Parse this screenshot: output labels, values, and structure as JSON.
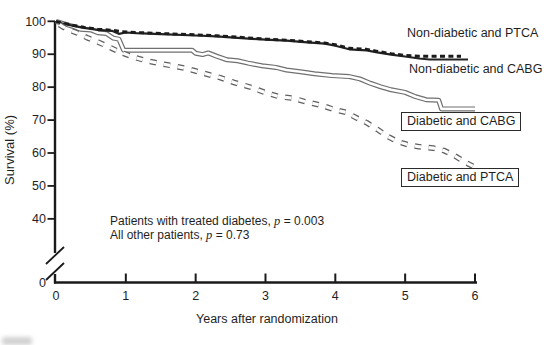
{
  "colors": {
    "axis": "#1a1a1a",
    "text": "#1f1f1f",
    "line_dark": "#232323",
    "line_dark_dashed": "#1b1b1b",
    "tube_edge": "#6f6f6f",
    "tube_fill": "#ffffff",
    "open_dash_edge": "#5f5f5f",
    "open_dash_fill": "#ffffff",
    "background": "#ffffff"
  },
  "chart_data": {
    "type": "line",
    "title": "",
    "xlabel": "Years after randomization",
    "ylabel": "Survival (%)",
    "x_ticks": [
      0,
      1,
      2,
      3,
      4,
      5,
      6
    ],
    "y_ticks": [
      100,
      90,
      80,
      70,
      60,
      50,
      40
    ],
    "y_origin_label": "0",
    "y_axis_break": true,
    "xlim": [
      0,
      6
    ],
    "ylim": [
      40,
      100
    ],
    "grid": false,
    "legend_position": "right-inline",
    "series": [
      {
        "name": "Diabetic and CABG",
        "style": "tube",
        "points": [
          [
            0,
            100
          ],
          [
            0.12,
            99.2
          ],
          [
            0.25,
            98.4
          ],
          [
            0.35,
            97.6
          ],
          [
            0.5,
            97.4
          ],
          [
            0.6,
            96.5
          ],
          [
            0.72,
            96.3
          ],
          [
            0.82,
            94.9
          ],
          [
            0.9,
            94.6
          ],
          [
            0.97,
            91.2
          ],
          [
            1.95,
            91.2
          ],
          [
            2.0,
            90.3
          ],
          [
            2.1,
            89.9
          ],
          [
            2.18,
            90.4
          ],
          [
            2.3,
            89.4
          ],
          [
            2.45,
            88.3
          ],
          [
            2.6,
            88.0
          ],
          [
            2.75,
            87.3
          ],
          [
            2.95,
            86.5
          ],
          [
            3.15,
            86.0
          ],
          [
            3.3,
            85.2
          ],
          [
            3.5,
            84.7
          ],
          [
            3.7,
            84.1
          ],
          [
            3.95,
            83.5
          ],
          [
            4.2,
            83.2
          ],
          [
            4.35,
            82.5
          ],
          [
            4.5,
            81.2
          ],
          [
            4.65,
            80.1
          ],
          [
            4.8,
            79.2
          ],
          [
            5.0,
            78.4
          ],
          [
            5.15,
            77.1
          ],
          [
            5.3,
            76.2
          ],
          [
            5.48,
            76.0
          ],
          [
            5.52,
            73.4
          ],
          [
            6.0,
            73.4
          ]
        ]
      },
      {
        "name": "Non-diabetic and CABG",
        "style": "dark-solid",
        "points": [
          [
            0,
            100
          ],
          [
            0.08,
            99.4
          ],
          [
            0.25,
            98.6
          ],
          [
            0.4,
            98.0
          ],
          [
            0.6,
            97.4
          ],
          [
            0.8,
            97.1
          ],
          [
            0.9,
            96.2
          ],
          [
            1.0,
            96.6
          ],
          [
            1.15,
            96.4
          ],
          [
            1.5,
            96.1
          ],
          [
            2.0,
            95.7
          ],
          [
            2.3,
            95.4
          ],
          [
            2.6,
            95.0
          ],
          [
            3.0,
            94.4
          ],
          [
            3.3,
            94.1
          ],
          [
            3.6,
            93.6
          ],
          [
            3.85,
            93.2
          ],
          [
            4.0,
            92.6
          ],
          [
            4.2,
            91.5
          ],
          [
            4.45,
            91.2
          ],
          [
            4.6,
            90.6
          ],
          [
            4.8,
            89.9
          ],
          [
            5.0,
            89.3
          ],
          [
            5.2,
            88.7
          ],
          [
            5.35,
            88.4
          ],
          [
            5.9,
            88.4
          ]
        ]
      },
      {
        "name": "Non-diabetic and PTCA",
        "style": "dark-dashed",
        "points": [
          [
            0,
            100
          ],
          [
            0.08,
            99.5
          ],
          [
            0.25,
            98.8
          ],
          [
            0.4,
            98.2
          ],
          [
            0.6,
            97.6
          ],
          [
            0.8,
            97.3
          ],
          [
            0.95,
            96.8
          ],
          [
            1.15,
            96.6
          ],
          [
            1.5,
            96.3
          ],
          [
            2.0,
            95.9
          ],
          [
            2.3,
            95.6
          ],
          [
            2.6,
            95.2
          ],
          [
            3.0,
            94.6
          ],
          [
            3.3,
            94.3
          ],
          [
            3.6,
            93.8
          ],
          [
            3.85,
            93.4
          ],
          [
            4.0,
            92.9
          ],
          [
            4.2,
            91.8
          ],
          [
            4.45,
            91.5
          ],
          [
            4.6,
            90.9
          ],
          [
            4.8,
            90.2
          ],
          [
            5.0,
            89.6
          ],
          [
            5.2,
            89.4
          ],
          [
            5.8,
            89.4
          ]
        ]
      },
      {
        "name": "Diabetic and PTCA",
        "style": "open-dashed",
        "points": [
          [
            0.05,
            99.0
          ],
          [
            0.1,
            98.3
          ],
          [
            0.2,
            97.3
          ],
          [
            0.3,
            96.5
          ],
          [
            0.45,
            95.0
          ],
          [
            0.6,
            93.7
          ],
          [
            0.75,
            92.3
          ],
          [
            0.9,
            90.8
          ],
          [
            1.1,
            89.2
          ],
          [
            1.3,
            88.0
          ],
          [
            1.5,
            87.1
          ],
          [
            1.7,
            86.4
          ],
          [
            1.9,
            85.5
          ],
          [
            2.1,
            84.3
          ],
          [
            2.35,
            82.9
          ],
          [
            2.55,
            81.4
          ],
          [
            2.8,
            79.9
          ],
          [
            3.0,
            78.3
          ],
          [
            3.2,
            77.1
          ],
          [
            3.4,
            76.6
          ],
          [
            3.6,
            75.4
          ],
          [
            3.8,
            74.5
          ],
          [
            4.0,
            73.1
          ],
          [
            4.15,
            72.4
          ],
          [
            4.3,
            70.7
          ],
          [
            4.45,
            69.2
          ],
          [
            4.6,
            67.2
          ],
          [
            4.75,
            65.0
          ],
          [
            4.9,
            63.4
          ],
          [
            5.05,
            62.5
          ],
          [
            5.2,
            61.9
          ],
          [
            5.4,
            61.5
          ],
          [
            5.55,
            60.8
          ],
          [
            5.7,
            59.3
          ],
          [
            5.85,
            57.3
          ],
          [
            5.97,
            56.0
          ]
        ]
      }
    ],
    "curve_labels": [
      {
        "text": "Non-diabetic and PTCA",
        "boxed": false
      },
      {
        "text": "Non-diabetic and CABG",
        "boxed": false
      },
      {
        "text": "Diabetic and CABG",
        "boxed": true
      },
      {
        "text": "Diabetic and PTCA",
        "boxed": true
      }
    ],
    "annotations": [
      {
        "prefix": "Patients with treated diabetes, ",
        "pvar": "p",
        "suffix": " = 0.003"
      },
      {
        "prefix": "All other patients, ",
        "pvar": "p",
        "suffix": " = 0.73"
      }
    ]
  }
}
